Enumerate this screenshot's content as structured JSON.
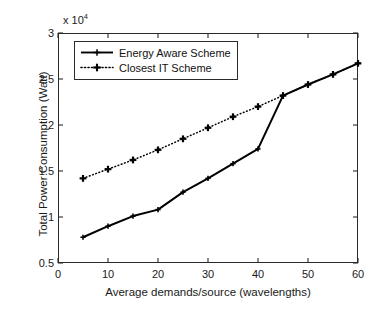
{
  "chart_data": {
    "type": "line",
    "title": "",
    "xlabel": "Average demands/source (wavelengths)",
    "ylabel": "Total Power Consumption (Watt)",
    "y_exponent_label": "x 10",
    "y_exponent_power": "4",
    "y_scale_factor": 10000,
    "xlim": [
      0,
      60
    ],
    "ylim": [
      0.5,
      3
    ],
    "xticks": [
      0,
      10,
      20,
      30,
      40,
      50,
      60
    ],
    "xtick_labels": [
      "0",
      "10",
      "20",
      "30",
      "40",
      "50",
      "60"
    ],
    "yticks": [
      0.5,
      1,
      1.5,
      2,
      2.5,
      3
    ],
    "ytick_labels": [
      "0.5",
      "1",
      "1.5",
      "2",
      "2.5",
      "3"
    ],
    "grid": false,
    "legend_position": "upper left",
    "x": [
      5,
      10,
      15,
      20,
      25,
      30,
      35,
      40,
      45,
      50,
      55,
      60
    ],
    "series": [
      {
        "name": "Energy Aware Scheme",
        "style": "solid",
        "marker": "plus",
        "color": "#000000",
        "x": [
          5,
          10,
          15,
          20,
          25,
          30,
          35,
          40,
          45,
          50,
          55,
          60
        ],
        "values": [
          0.78,
          0.9,
          1.01,
          1.08,
          1.27,
          1.42,
          1.58,
          1.74,
          2.32,
          2.44,
          2.55,
          2.67
        ]
      },
      {
        "name": "Closest IT Scheme",
        "style": "dotted",
        "marker": "plus",
        "color": "#000000",
        "x": [
          5,
          10,
          15,
          20,
          25,
          30,
          35,
          40,
          45,
          50,
          55,
          60
        ],
        "values": [
          1.42,
          1.52,
          1.62,
          1.73,
          1.85,
          1.97,
          2.09,
          2.2,
          2.32,
          2.44,
          2.55,
          2.67
        ]
      }
    ],
    "legend": [
      {
        "label": "Energy Aware Scheme",
        "style": "solid",
        "marker": "plus"
      },
      {
        "label": "Closest IT Scheme",
        "style": "dotted",
        "marker": "plus"
      }
    ]
  }
}
